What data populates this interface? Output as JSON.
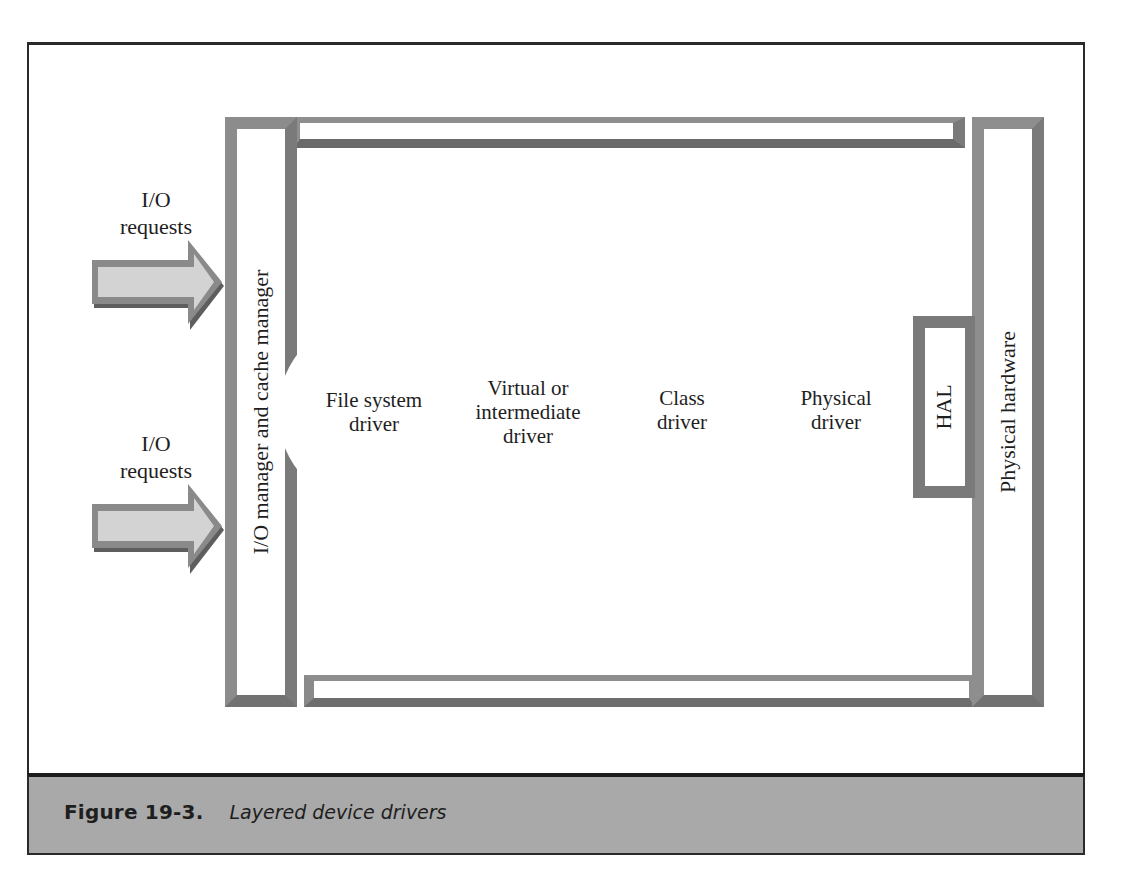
{
  "figure": {
    "number": "Figure 19-3.",
    "title": "Layered device drivers"
  },
  "inputs": [
    {
      "label": "I/O\nrequests",
      "arrow_icon": "right-arrow"
    },
    {
      "label": "I/O\nrequests",
      "arrow_icon": "right-arrow"
    }
  ],
  "layers": {
    "io_manager": "I/O manager and cache manager",
    "drivers": [
      {
        "label": "File system\ndriver"
      },
      {
        "label": "Virtual or\nintermediate\ndriver"
      },
      {
        "label": "Class\ndriver"
      },
      {
        "label": "Physical\ndriver"
      }
    ],
    "hal": "HAL",
    "hardware": "Physical hardware"
  },
  "colors": {
    "bar_border": "#8a8a8a",
    "caption_band": "#a9a9a9",
    "arrow_fill": "#d0d0d0",
    "arrow_shadow": "#6a6a6a"
  }
}
